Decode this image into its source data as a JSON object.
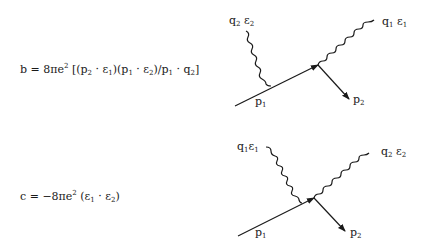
{
  "equations": {
    "b": {
      "lhs": "b",
      "eq": "=",
      "prefix": "8πe",
      "power": "2",
      "body_1": "[(p",
      "s1": "2",
      "body_2": " · ε",
      "s2": "1",
      "body_3": ")(p",
      "s3": "1",
      "body_4": " · ε",
      "s4": "2",
      "body_5": ")/p",
      "s5": "1",
      "body_6": " · q",
      "s6": "2",
      "body_7": "]"
    },
    "c": {
      "lhs": "c",
      "eq": "=",
      "prefix": "−8πe",
      "power": "2",
      "body_1": "(ε",
      "s1": "1",
      "body_2": " · ε",
      "s2": "2",
      "body_3": ")"
    }
  },
  "diagram_top": {
    "incoming_photon": {
      "q": "q",
      "q_sub": "2",
      "e": "ε",
      "e_sub": "2"
    },
    "outgoing_photon": {
      "q": "q",
      "q_sub": "1",
      "e": "ε",
      "e_sub": "1"
    },
    "incoming_electron": {
      "p": "p",
      "p_sub": "1"
    },
    "outgoing_electron": {
      "p": "p",
      "p_sub": "2"
    }
  },
  "diagram_bottom": {
    "incoming_photon": {
      "q": "q",
      "q_sub": "1",
      "e": "ε",
      "e_sub": "1"
    },
    "outgoing_photon": {
      "q": "q",
      "q_sub": "2",
      "e": "ε",
      "e_sub": "2"
    },
    "incoming_electron": {
      "p": "p",
      "p_sub": "1"
    },
    "outgoing_electron": {
      "p": "p",
      "p_sub": "2"
    }
  }
}
